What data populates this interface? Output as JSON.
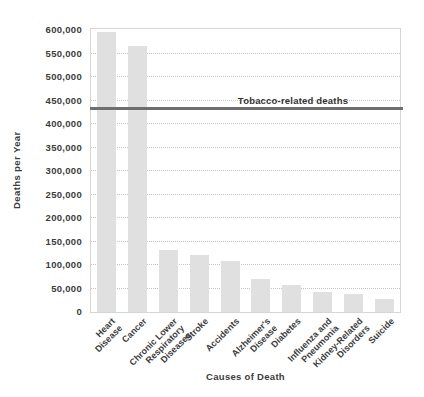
{
  "chart_data": {
    "type": "bar",
    "title": "",
    "xlabel": "Causes of Death",
    "ylabel": "Deaths per Year",
    "categories": [
      "Heart Disease",
      "Cancer",
      "Chronic Lower\nRespiratory\nDiseases",
      "Stroke",
      "Accidents",
      "Alzheimer's\nDisease",
      "Diabetes",
      "Influenza and\nPneumonia",
      "Kidney-Related\nDisorders",
      "Suicide"
    ],
    "values": [
      595000,
      565000,
      132000,
      122000,
      108000,
      70000,
      57000,
      43000,
      38000,
      28000
    ],
    "ylim": [
      0,
      600000
    ],
    "ytick_interval": 50000,
    "yticks": [
      {
        "value": 0,
        "label": "0"
      },
      {
        "value": 50000,
        "label": "50,000"
      },
      {
        "value": 100000,
        "label": "100,000"
      },
      {
        "value": 150000,
        "label": "150,000"
      },
      {
        "value": 200000,
        "label": "200,000"
      },
      {
        "value": 250000,
        "label": "250,000"
      },
      {
        "value": 300000,
        "label": "300,000"
      },
      {
        "value": 350000,
        "label": "350,000"
      },
      {
        "value": 400000,
        "label": "400,000"
      },
      {
        "value": 450000,
        "label": "450,000"
      },
      {
        "value": 500000,
        "label": "500,000"
      },
      {
        "value": 550000,
        "label": "550,000"
      },
      {
        "value": 600000,
        "label": "600,000"
      }
    ],
    "grid": "horizontal-dotted",
    "legend": "none",
    "reference_line": {
      "label": "Tobacco-related deaths",
      "value": 430000
    },
    "colors": {
      "bar": "#e0e0e0",
      "reference_line": "#6e6e6e",
      "gridline": "#c6c6c6",
      "frame": "#d6d6d6",
      "text": "#3c3c3c",
      "background": "#ffffff"
    }
  }
}
